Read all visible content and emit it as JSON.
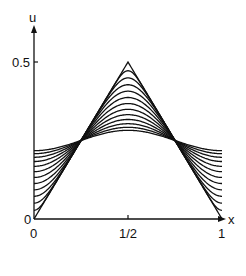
{
  "chart_data": {
    "type": "line",
    "title": "",
    "xlabel": "x",
    "ylabel": "u",
    "xlim": [
      0,
      1
    ],
    "ylim": [
      0,
      0.5
    ],
    "x_ticks": [
      {
        "value": 0,
        "label": "0"
      },
      {
        "value": 0.5,
        "label": "1/2"
      },
      {
        "value": 1,
        "label": "1"
      }
    ],
    "y_ticks": [
      {
        "value": 0,
        "label": "0"
      },
      {
        "value": 0.5,
        "label": "0.5"
      }
    ],
    "grid": false,
    "legend": null,
    "initial_condition": {
      "x": [
        0,
        0.5,
        1
      ],
      "u": [
        0,
        0.5,
        0
      ]
    },
    "num_curves": 13,
    "series_summary": [
      {
        "curve": 0,
        "u_at_0": 0.0,
        "u_at_half": 0.5
      },
      {
        "curve": 1,
        "u_at_0": 0.075,
        "u_at_half": 0.42
      },
      {
        "curve": 12,
        "u_at_0": 0.225,
        "u_at_half": 0.27
      }
    ]
  }
}
